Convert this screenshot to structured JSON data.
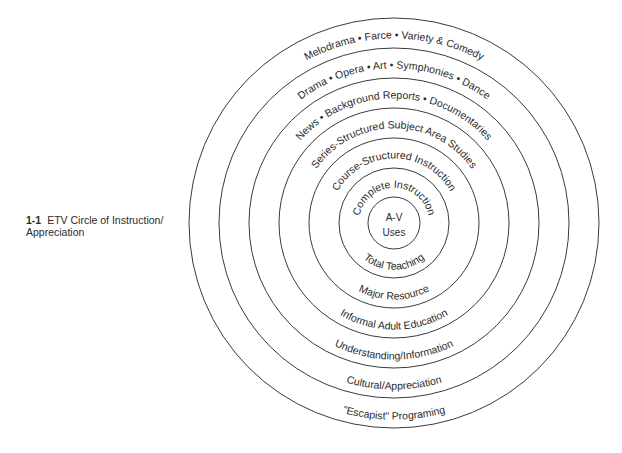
{
  "caption": {
    "number": "1-1",
    "title_line1": "ETV Circle of Instruction/",
    "title_line2": "Appreciation"
  },
  "diagram": {
    "center": {
      "x": 394,
      "y": 223
    },
    "ring_radii": [
      26,
      55,
      85,
      115,
      145,
      175,
      205
    ],
    "core": {
      "line1": "A-V",
      "line2": "Uses"
    },
    "bands": [
      {
        "top": "Complete Instruction",
        "bottom": "Total Teaching"
      },
      {
        "top": "Course-Structured Instruction",
        "bottom": "Major Resource"
      },
      {
        "top": "Series-Structured Subject Area Studies",
        "bottom": "Informal Adult Education"
      },
      {
        "top": "News • Background Reports • Documentaries",
        "bottom": "Understanding/Information"
      },
      {
        "top": "Drama • Opera • Art • Symphonies • Dance",
        "bottom": "Cultural/Appreciation"
      },
      {
        "top": "Melodrama • Farce • Variety & Comedy",
        "bottom": "\"Escapist\" Programing"
      }
    ],
    "line_color": "#3a3a3a",
    "text_color": "#2a2a2a"
  }
}
